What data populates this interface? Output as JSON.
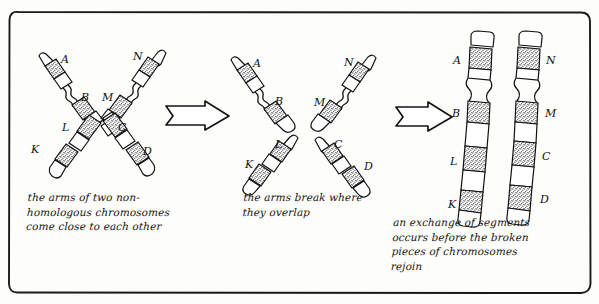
{
  "figure": {
    "border_color": "#1a1a1a",
    "ink_color": "#111111",
    "band_fill": "stipple",
    "background": "#fdfdfb"
  },
  "panels": [
    {
      "id": "panel-1",
      "stage": 1,
      "caption": "the arms of two non-\nhomologous chromosomes\ncome close to each other",
      "labels": [
        "A",
        "B",
        "M",
        "N",
        "L",
        "C",
        "K",
        "D"
      ]
    },
    {
      "id": "panel-2",
      "stage": 2,
      "caption": "the arms break where\nthey overlap",
      "labels": [
        "A",
        "B",
        "M",
        "N",
        "L",
        "K",
        "C",
        "D"
      ]
    },
    {
      "id": "panel-3",
      "stage": 3,
      "caption": "an exchange of segments\noccurs before the broken\npieces of chromosomes\nrejoin",
      "labels": [
        "A",
        "B",
        "L",
        "K",
        "N",
        "M",
        "C",
        "D"
      ]
    }
  ],
  "labels": {
    "A": "A",
    "B": "B",
    "C": "C",
    "D": "D",
    "K": "K",
    "L": "L",
    "M": "M",
    "N": "N"
  },
  "arrows": [
    {
      "id": "arrow-1",
      "from": "panel-1",
      "to": "panel-2"
    },
    {
      "id": "arrow-2",
      "from": "panel-2",
      "to": "panel-3"
    }
  ]
}
